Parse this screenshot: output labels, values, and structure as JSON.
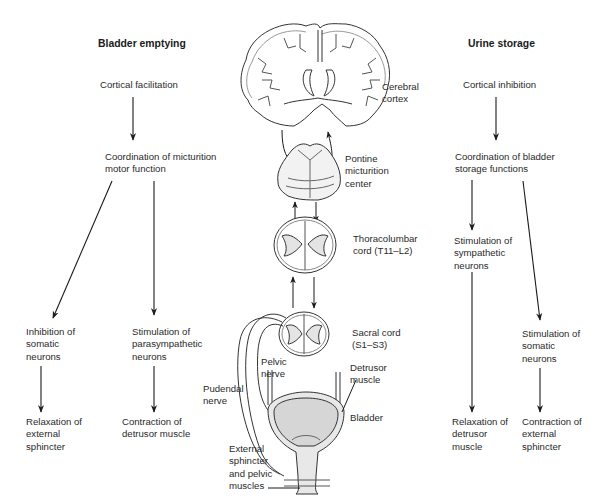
{
  "diagram": {
    "title_left": "Bladder emptying",
    "title_right": "Urine storage",
    "left_column": {
      "cortical": "Cortical facilitation",
      "coordination": "Coordination of micturition\nmotor function",
      "branch_a": {
        "neurons": "Inhibition of\nsomatic\nneurons",
        "effect": "Relaxation of\nexternal\nsphincter"
      },
      "branch_b": {
        "neurons": "Stimulation of\nparasympathetic\nneurons",
        "effect": "Contraction of\ndetrusor muscle"
      }
    },
    "right_column": {
      "cortical": "Cortical inhibition",
      "coordination": "Coordination of bladder\nstorage functions",
      "branch_a": {
        "neurons": "Stimulation of\nsympathetic\nneurons",
        "effect": "Relaxation of\ndetrusor\nmuscle"
      },
      "branch_b": {
        "neurons": "Stimulation of\nsomatic\nneurons",
        "effect": "Contraction of\nexternal\nsphincter"
      }
    },
    "anatomy_labels": {
      "cerebral_cortex": "Cerebral\ncortex",
      "pontine": "Pontine\nmicturition\ncenter",
      "thoracolumbar": "Thoracolumbar\ncord (T11–L2)",
      "sacral": "Sacral cord\n(S1–S3)",
      "pelvic_nerve": "Pelvic\nnerve",
      "pudendal_nerve": "Pudendal\nnerve",
      "detrusor": "Detrusor\nmuscle",
      "bladder": "Bladder",
      "external_sphincter": "External\nsphincter\nand pelvic\nmuscles"
    },
    "colors": {
      "line": "#1a1a1a",
      "tissue_fill": "#e4e4e4",
      "bladder_fill": "#d6d6d6",
      "text": "#2a2a2a"
    }
  }
}
